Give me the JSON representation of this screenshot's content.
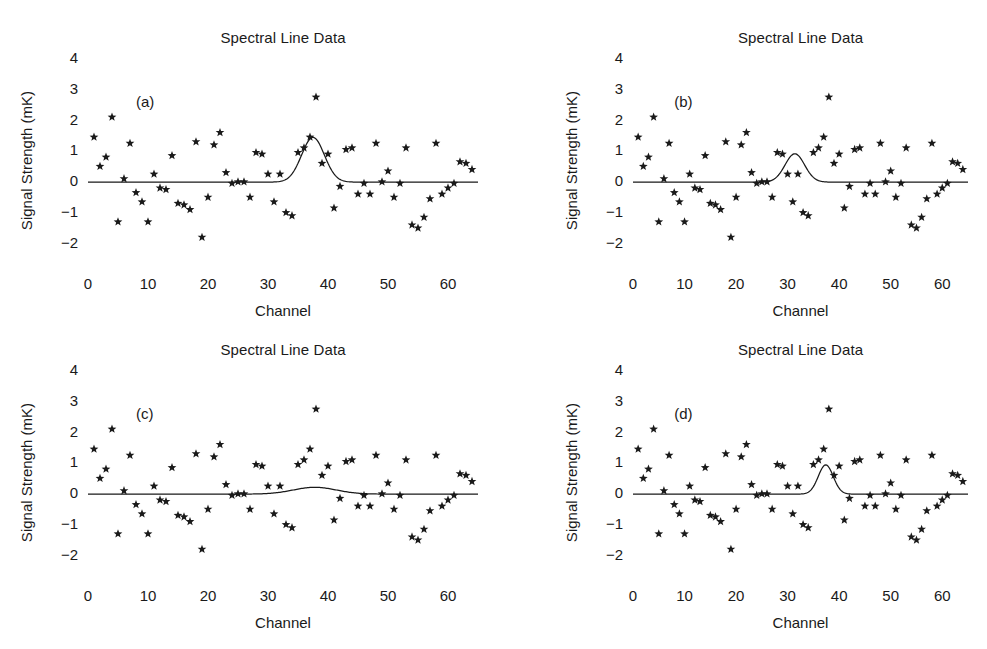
{
  "figure": {
    "width": 987,
    "height": 649,
    "background": "#ffffff",
    "ink_color": "#1a1a1a",
    "panel_count": 4
  },
  "common": {
    "title": "Spectral Line Data",
    "xlabel": "Channel",
    "ylabel": "Signal Strength (mK)",
    "xticks": [
      0,
      10,
      20,
      30,
      40,
      50,
      60
    ],
    "xtick_labels": [
      "0",
      "10",
      "20",
      "30",
      "40",
      "50",
      "60"
    ],
    "yticks": [
      -2,
      -1,
      0,
      1,
      2,
      3,
      4
    ],
    "ytick_labels": [
      "−2",
      "−1",
      "0",
      "1",
      "2",
      "3",
      "4"
    ],
    "xlim": [
      0,
      65
    ],
    "ylim": [
      -2.75,
      4
    ],
    "minor_tick_interval_x": 2,
    "minor_tick_interval_y": 0.25,
    "grid": false,
    "legend": false,
    "marker": "star",
    "marker_color": "#1a1a1a",
    "line_color": "#1a1a1a"
  },
  "chart_data": [
    {
      "type": "scatter",
      "panel": "(a)",
      "title": "Spectral Line Data",
      "xlabel": "Channel",
      "ylabel": "Signal Strength (mK)",
      "xlim": [
        0,
        65
      ],
      "ylim": [
        -2.75,
        4
      ],
      "grid": false,
      "series": [
        {
          "name": "data",
          "marker": "star",
          "x": [
            1,
            2,
            3,
            4,
            5,
            6,
            7,
            8,
            9,
            10,
            11,
            12,
            13,
            14,
            15,
            16,
            17,
            18,
            19,
            20,
            21,
            22,
            23,
            24,
            25,
            26,
            27,
            28,
            29,
            30,
            31,
            32,
            33,
            34,
            35,
            36,
            37,
            38,
            39,
            40,
            41,
            42,
            43,
            44,
            45,
            46,
            47,
            48,
            49,
            50,
            51,
            52,
            53,
            54,
            55,
            56,
            57,
            58,
            59,
            60,
            61,
            62,
            63,
            64
          ],
          "y": [
            1.4,
            0.45,
            0.75,
            2.05,
            -1.35,
            0.05,
            1.2,
            -0.4,
            -0.7,
            -1.35,
            0.2,
            -0.25,
            -0.3,
            0.8,
            -0.75,
            -0.8,
            -0.95,
            1.25,
            -1.85,
            -0.55,
            1.15,
            1.55,
            0.25,
            -0.1,
            -0.05,
            -0.05,
            -0.55,
            0.9,
            0.85,
            0.2,
            -0.7,
            0.2,
            -1.05,
            -1.15,
            0.9,
            1.05,
            1.4,
            2.7,
            0.55,
            0.85,
            -0.9,
            -0.2,
            1.0,
            1.05,
            -0.45,
            -0.1,
            -0.45,
            1.2,
            -0.05,
            0.3,
            -0.55,
            -0.1,
            1.05,
            -1.45,
            -1.55,
            -1.2,
            -0.6,
            1.2,
            -0.45,
            -0.25,
            -0.1,
            0.6,
            0.55,
            0.35
          ]
        },
        {
          "name": "gaussian-fit",
          "type": "line",
          "amplitude": 1.45,
          "center": 37.5,
          "sigma": 1.9,
          "baseline": -0.06
        }
      ]
    },
    {
      "type": "scatter",
      "panel": "(b)",
      "title": "Spectral Line Data",
      "xlabel": "Channel",
      "ylabel": "Signal Strength (mK)",
      "xlim": [
        0,
        65
      ],
      "ylim": [
        -2.75,
        4
      ],
      "grid": false,
      "series": [
        {
          "name": "data",
          "marker": "star",
          "x": [
            1,
            2,
            3,
            4,
            5,
            6,
            7,
            8,
            9,
            10,
            11,
            12,
            13,
            14,
            15,
            16,
            17,
            18,
            19,
            20,
            21,
            22,
            23,
            24,
            25,
            26,
            27,
            28,
            29,
            30,
            31,
            32,
            33,
            34,
            35,
            36,
            37,
            38,
            39,
            40,
            41,
            42,
            43,
            44,
            45,
            46,
            47,
            48,
            49,
            50,
            51,
            52,
            53,
            54,
            55,
            56,
            57,
            58,
            59,
            60,
            61,
            62,
            63,
            64
          ],
          "y": [
            1.4,
            0.45,
            0.75,
            2.05,
            -1.35,
            0.05,
            1.2,
            -0.4,
            -0.7,
            -1.35,
            0.2,
            -0.25,
            -0.3,
            0.8,
            -0.75,
            -0.8,
            -0.95,
            1.25,
            -1.85,
            -0.55,
            1.15,
            1.55,
            0.25,
            -0.1,
            -0.05,
            -0.05,
            -0.55,
            0.9,
            0.85,
            0.2,
            -0.7,
            0.2,
            -1.05,
            -1.15,
            0.9,
            1.05,
            1.4,
            2.7,
            0.55,
            0.85,
            -0.9,
            -0.2,
            1.0,
            1.05,
            -0.45,
            -0.1,
            -0.45,
            1.2,
            -0.05,
            0.3,
            -0.55,
            -0.1,
            1.05,
            -1.45,
            -1.55,
            -1.2,
            -0.6,
            1.2,
            -0.45,
            -0.25,
            -0.1,
            0.6,
            0.55,
            0.35
          ]
        },
        {
          "name": "gaussian-fit",
          "type": "line",
          "amplitude": 0.92,
          "center": 31.4,
          "sigma": 1.9,
          "baseline": -0.06
        }
      ]
    },
    {
      "type": "scatter",
      "panel": "(c)",
      "title": "Spectral Line Data",
      "xlabel": "Channel",
      "ylabel": "Signal Strength (mK)",
      "xlim": [
        0,
        65
      ],
      "ylim": [
        -2.75,
        4
      ],
      "grid": false,
      "series": [
        {
          "name": "data",
          "marker": "star",
          "x": [
            1,
            2,
            3,
            4,
            5,
            6,
            7,
            8,
            9,
            10,
            11,
            12,
            13,
            14,
            15,
            16,
            17,
            18,
            19,
            20,
            21,
            22,
            23,
            24,
            25,
            26,
            27,
            28,
            29,
            30,
            31,
            32,
            33,
            34,
            35,
            36,
            37,
            38,
            39,
            40,
            41,
            42,
            43,
            44,
            45,
            46,
            47,
            48,
            49,
            50,
            51,
            52,
            53,
            54,
            55,
            56,
            57,
            58,
            59,
            60,
            61,
            62,
            63,
            64
          ],
          "y": [
            1.4,
            0.45,
            0.75,
            2.05,
            -1.35,
            0.05,
            1.2,
            -0.4,
            -0.7,
            -1.35,
            0.2,
            -0.25,
            -0.3,
            0.8,
            -0.75,
            -0.8,
            -0.95,
            1.25,
            -1.85,
            -0.55,
            1.15,
            1.55,
            0.25,
            -0.1,
            -0.05,
            -0.05,
            -0.55,
            0.9,
            0.85,
            0.2,
            -0.7,
            0.2,
            -1.05,
            -1.15,
            0.9,
            1.05,
            1.4,
            2.7,
            0.55,
            0.85,
            -0.9,
            -0.2,
            1.0,
            1.05,
            -0.45,
            -0.1,
            -0.45,
            1.2,
            -0.05,
            0.3,
            -0.55,
            -0.1,
            1.05,
            -1.45,
            -1.55,
            -1.2,
            -0.6,
            1.2,
            -0.45,
            -0.25,
            -0.1,
            0.6,
            0.55,
            0.35
          ]
        },
        {
          "name": "gaussian-fit",
          "type": "line",
          "amplitude": 0.22,
          "center": 37.8,
          "sigma": 3.6,
          "baseline": -0.06
        }
      ]
    },
    {
      "type": "scatter",
      "panel": "(d)",
      "title": "Spectral Line Data",
      "xlabel": "Channel",
      "ylabel": "Signal Strength (mK)",
      "xlim": [
        0,
        65
      ],
      "ylim": [
        -2.75,
        4
      ],
      "grid": false,
      "series": [
        {
          "name": "data",
          "marker": "star",
          "x": [
            1,
            2,
            3,
            4,
            5,
            6,
            7,
            8,
            9,
            10,
            11,
            12,
            13,
            14,
            15,
            16,
            17,
            18,
            19,
            20,
            21,
            22,
            23,
            24,
            25,
            26,
            27,
            28,
            29,
            30,
            31,
            32,
            33,
            34,
            35,
            36,
            37,
            38,
            39,
            40,
            41,
            42,
            43,
            44,
            45,
            46,
            47,
            48,
            49,
            50,
            51,
            52,
            53,
            54,
            55,
            56,
            57,
            58,
            59,
            60,
            61,
            62,
            63,
            64
          ],
          "y": [
            1.4,
            0.45,
            0.75,
            2.05,
            -1.35,
            0.05,
            1.2,
            -0.4,
            -0.7,
            -1.35,
            0.2,
            -0.25,
            -0.3,
            0.8,
            -0.75,
            -0.8,
            -0.95,
            1.25,
            -1.85,
            -0.55,
            1.15,
            1.55,
            0.25,
            -0.1,
            -0.05,
            -0.05,
            -0.55,
            0.9,
            0.85,
            0.2,
            -0.7,
            0.2,
            -1.05,
            -1.15,
            0.9,
            1.05,
            1.4,
            2.7,
            0.55,
            0.85,
            -0.9,
            -0.2,
            1.0,
            1.05,
            -0.45,
            -0.1,
            -0.45,
            1.2,
            -0.05,
            0.3,
            -0.55,
            -0.1,
            1.05,
            -1.45,
            -1.55,
            -1.2,
            -0.6,
            1.2,
            -0.45,
            -0.25,
            -0.1,
            0.6,
            0.55,
            0.35
          ]
        },
        {
          "name": "gaussian-fit",
          "type": "line",
          "amplitude": 0.95,
          "center": 37.4,
          "sigma": 1.45,
          "baseline": -0.06
        }
      ]
    }
  ]
}
